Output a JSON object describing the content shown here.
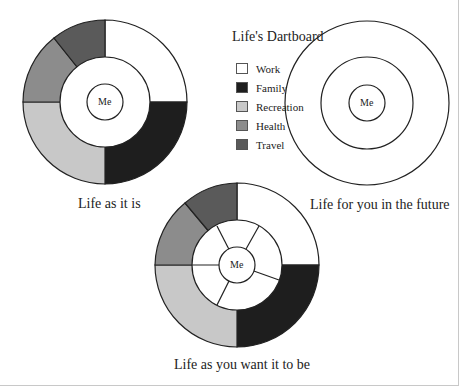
{
  "title": "Life's Dartboard",
  "center_label": "Me",
  "legend": [
    {
      "label": "Work",
      "color": "#ffffff"
    },
    {
      "label": "Family",
      "color": "#1e1e1e"
    },
    {
      "label": "Recreation",
      "color": "#c8c8c8"
    },
    {
      "label": "Health",
      "color": "#8c8c8c"
    },
    {
      "label": "Travel",
      "color": "#5a5a5a"
    }
  ],
  "diagrams": {
    "current": {
      "caption": "Life as it is"
    },
    "future": {
      "caption": "Life for you in the future"
    },
    "desired": {
      "caption": "Life as you want it to be"
    }
  }
}
